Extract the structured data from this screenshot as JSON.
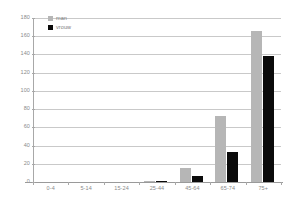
{
  "chart_data": {
    "type": "bar",
    "title": "",
    "subtitle": "",
    "xlabel": "",
    "ylabel": "",
    "categories": [
      "0-4",
      "5-14",
      "15-24",
      "25-44",
      "45-64",
      "65-74",
      "75+"
    ],
    "series": [
      {
        "name": "man",
        "color": "#b6b6b6",
        "values": [
          0,
          0,
          0,
          1,
          15,
          72,
          166
        ]
      },
      {
        "name": "vrouw",
        "color": "#0a0a0a",
        "values": [
          0,
          0,
          0,
          1,
          7,
          33,
          138
        ]
      }
    ],
    "ylim": [
      0,
      180
    ],
    "yticks": [
      0,
      20,
      40,
      60,
      80,
      100,
      120,
      140,
      160,
      180
    ],
    "ytick_labels": [
      "0",
      "20",
      "40",
      "60",
      "80",
      "100",
      "120",
      "140",
      "160",
      "180"
    ],
    "grid": true,
    "grid_axis": "y",
    "legend_position": "top-left",
    "legend": [
      "man",
      "vrouw"
    ],
    "annotations": []
  },
  "colors": {
    "man": "#b6b6b6",
    "vrouw": "#0a0a0a",
    "gridline": "#c9c9c9",
    "axis": "#9a9a9a",
    "tick_text": "#8a8a8a",
    "background": "#ffffff"
  }
}
